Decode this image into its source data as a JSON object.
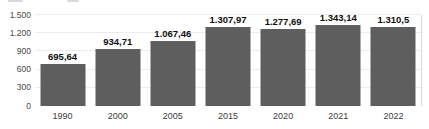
{
  "chart_data": {
    "type": "bar",
    "categories": [
      "1990",
      "2000",
      "2005",
      "2015",
      "2020",
      "2021",
      "2022"
    ],
    "values": [
      695.64,
      934.71,
      1067.46,
      1307.97,
      1277.69,
      1343.14,
      1310.5
    ],
    "value_labels": [
      "695,64",
      "934,71",
      "1.067,46",
      "1.307,97",
      "1.277,69",
      "1.343,14",
      "1.310,5"
    ],
    "title": "",
    "xlabel": "",
    "ylabel": "",
    "ylim": [
      0,
      1500
    ],
    "y_ticks": [
      0,
      300,
      600,
      900,
      1200,
      1500
    ],
    "y_tick_labels": [
      "0",
      "300",
      "600",
      "900",
      "1.200",
      "1.500"
    ],
    "grid": "horizontal",
    "legend": "none",
    "bar_color": "#5e5e5e",
    "gridline_color": "#ececec",
    "plot_border_right_color": "#d9d9d9"
  }
}
